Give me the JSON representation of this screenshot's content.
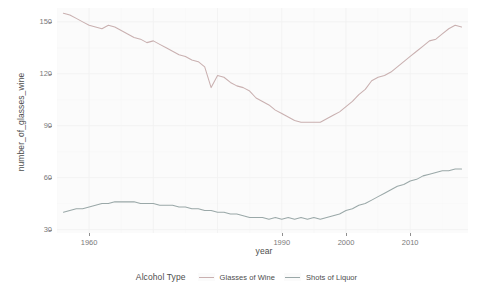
{
  "chart_data": {
    "type": "line",
    "title": "",
    "xlabel": "year",
    "ylabel": "number_of_glasses_wine",
    "xlim": [
      1955,
      2019
    ],
    "ylim": [
      28,
      158
    ],
    "xticks": [
      1960,
      1990,
      2000,
      2010
    ],
    "xtick_labels": [
      "1960",
      "1990",
      "2000",
      "2010"
    ],
    "yticks": [
      30,
      60,
      90,
      120,
      150
    ],
    "ytick_labels": [
      "30",
      "60",
      "90",
      "120",
      "150"
    ],
    "grid": true,
    "legend_position": "bottom",
    "legend_title": "Alcohol Type",
    "series": [
      {
        "name": "Glasses of Wine",
        "color": "#c9b0b0",
        "x": [
          1956,
          1957,
          1958,
          1959,
          1960,
          1961,
          1962,
          1963,
          1964,
          1965,
          1966,
          1967,
          1968,
          1969,
          1970,
          1971,
          1972,
          1973,
          1974,
          1975,
          1976,
          1977,
          1978,
          1979,
          1980,
          1981,
          1982,
          1983,
          1984,
          1985,
          1986,
          1987,
          1988,
          1989,
          1990,
          1991,
          1992,
          1993,
          1994,
          1995,
          1996,
          1997,
          1998,
          1999,
          2000,
          2001,
          2002,
          2003,
          2004,
          2005,
          2006,
          2007,
          2008,
          2009,
          2010,
          2011,
          2012,
          2013,
          2014,
          2015,
          2016,
          2017,
          2018
        ],
        "values": [
          155,
          154,
          152,
          150,
          148,
          147,
          146,
          148,
          147,
          145,
          143,
          141,
          140,
          138,
          139,
          137,
          135,
          133,
          131,
          130,
          128,
          127,
          124,
          112,
          119,
          118,
          115,
          113,
          112,
          110,
          106,
          104,
          102,
          99,
          97,
          95,
          93,
          92,
          92,
          92,
          92,
          94,
          96,
          98,
          101,
          104,
          108,
          111,
          116,
          118,
          119,
          121,
          124,
          127,
          130,
          133,
          136,
          139,
          140,
          143,
          146,
          148,
          147
        ]
      },
      {
        "name": "Shots of Liquor",
        "color": "#9aa8a8",
        "x": [
          1956,
          1957,
          1958,
          1959,
          1960,
          1961,
          1962,
          1963,
          1964,
          1965,
          1966,
          1967,
          1968,
          1969,
          1970,
          1971,
          1972,
          1973,
          1974,
          1975,
          1976,
          1977,
          1978,
          1979,
          1980,
          1981,
          1982,
          1983,
          1984,
          1985,
          1986,
          1987,
          1988,
          1989,
          1990,
          1991,
          1992,
          1993,
          1994,
          1995,
          1996,
          1997,
          1998,
          1999,
          2000,
          2001,
          2002,
          2003,
          2004,
          2005,
          2006,
          2007,
          2008,
          2009,
          2010,
          2011,
          2012,
          2013,
          2014,
          2015,
          2016,
          2017,
          2018
        ],
        "values": [
          40,
          41,
          42,
          42,
          43,
          44,
          45,
          45,
          46,
          46,
          46,
          46,
          45,
          45,
          45,
          44,
          44,
          44,
          43,
          43,
          42,
          42,
          41,
          41,
          40,
          40,
          39,
          39,
          38,
          37,
          37,
          37,
          36,
          37,
          36,
          37,
          36,
          37,
          36,
          37,
          36,
          37,
          38,
          39,
          41,
          42,
          44,
          45,
          47,
          49,
          51,
          53,
          55,
          56,
          58,
          59,
          61,
          62,
          63,
          64,
          64,
          65,
          65
        ]
      }
    ]
  }
}
